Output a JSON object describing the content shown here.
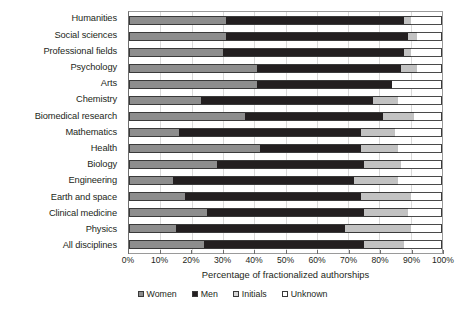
{
  "chart_data": {
    "type": "bar",
    "orientation": "horizontal",
    "stacked": true,
    "title": "",
    "xlabel": "Percentage of fractionalized authorships",
    "ylabel": "",
    "xlim": [
      0,
      100
    ],
    "grid": true,
    "legend_position": "bottom",
    "x_tick_labels": [
      "0%",
      "10%",
      "20%",
      "30%",
      "40%",
      "50%",
      "60%",
      "70%",
      "80%",
      "90%",
      "100%"
    ],
    "x_tick_values": [
      0,
      10,
      20,
      30,
      40,
      50,
      60,
      70,
      80,
      90,
      100
    ],
    "categories": [
      "Humanities",
      "Social sciences",
      "Professional fields",
      "Psychology",
      "Arts",
      "Chemistry",
      "Biomedical research",
      "Mathematics",
      "Health",
      "Biology",
      "Engineering",
      "Earth and space",
      "Clinical medicine",
      "Physics",
      "All disciplines"
    ],
    "series": [
      {
        "name": "Women",
        "color": "#8d8d8d",
        "values": [
          31,
          31,
          30,
          41,
          41,
          23,
          37,
          16,
          42,
          28,
          14,
          18,
          25,
          15,
          24
        ]
      },
      {
        "name": "Men",
        "color": "#231f20",
        "values": [
          57,
          58,
          58,
          46,
          43,
          55,
          44,
          58,
          32,
          47,
          58,
          56,
          50,
          54,
          51
        ]
      },
      {
        "name": "Initials",
        "color": "#c2c2c2",
        "values": [
          2,
          3,
          2,
          5,
          0,
          8,
          10,
          11,
          12,
          12,
          14,
          16,
          14,
          21,
          13
        ]
      },
      {
        "name": "Unknown",
        "color": "#ffffff",
        "values": [
          10,
          8,
          10,
          8,
          16,
          14,
          9,
          15,
          14,
          13,
          14,
          10,
          11,
          10,
          12
        ]
      }
    ],
    "legend_entries": [
      "Women",
      "Men",
      "Initials",
      "Unknown"
    ]
  }
}
